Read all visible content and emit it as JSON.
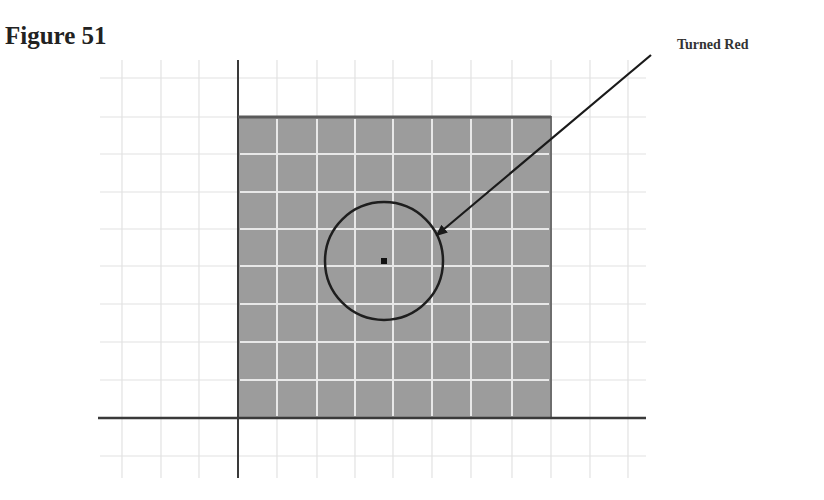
{
  "figure": {
    "title": "Figure 51",
    "annotation_label": "Turned Red"
  },
  "diagram": {
    "grid": {
      "vertical_lines_x": [
        122,
        161,
        199,
        277,
        317,
        355,
        393,
        432,
        471,
        512,
        590,
        628
      ],
      "horizontal_lines_y": [
        78,
        154,
        192,
        229,
        266,
        304,
        342,
        380,
        456
      ],
      "x_range": [
        100,
        646
      ],
      "y_range": [
        60,
        478
      ],
      "color": "#e2e2e2"
    },
    "axes": {
      "vertical_x": 238,
      "horizontal_y": 418,
      "color": "#3a3a3a"
    },
    "shaded_rect": {
      "x": 238,
      "y": 117,
      "width": 313,
      "height": 301,
      "fill": "#9c9c9c",
      "inner_grid_color": "#e8e8e8"
    },
    "circle": {
      "cx": 384,
      "cy": 261,
      "r": 59,
      "stroke": "#1e1e1e"
    },
    "center_point": {
      "cx": 384,
      "cy": 261,
      "size": 6
    },
    "arrow": {
      "from": [
        651,
        55
      ],
      "to": [
        437,
        235
      ],
      "color": "#1a1a1a"
    }
  },
  "colors": {
    "background": "#ffffff",
    "text": "#222222",
    "shade": "#9c9c9c"
  }
}
